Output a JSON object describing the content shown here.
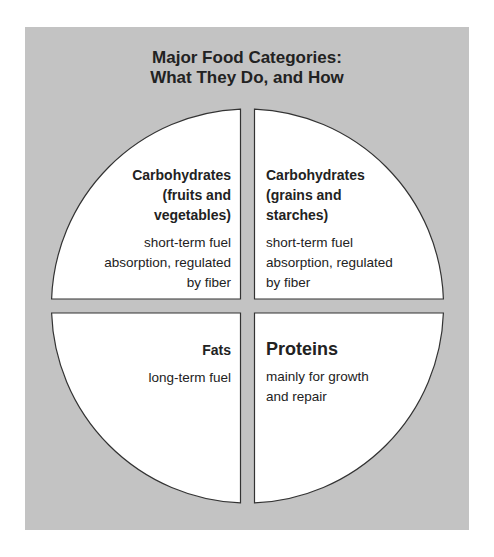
{
  "title": {
    "line1": "Major Food Categories:",
    "line2": "What They Do, and How"
  },
  "colors": {
    "background": "#c3c3c3",
    "quadrant_fill": "#ffffff",
    "outline": "#333333",
    "text": "#222222"
  },
  "quadrants": {
    "top_left": {
      "heading": [
        "Carbohydrates",
        "(fruits and",
        "vegetables)"
      ],
      "body": [
        "short-term fuel",
        "absorption, regulated",
        "by fiber"
      ]
    },
    "top_right": {
      "heading": [
        "Carbohydrates",
        "(grains and",
        "starches)"
      ],
      "body": [
        "short-term fuel",
        "absorption, regulated",
        "by fiber"
      ]
    },
    "bottom_left": {
      "heading": [
        "Fats"
      ],
      "body": [
        "long-term fuel"
      ]
    },
    "bottom_right": {
      "heading": [
        "Proteins"
      ],
      "body": [
        "mainly for growth",
        "and repair"
      ]
    }
  }
}
